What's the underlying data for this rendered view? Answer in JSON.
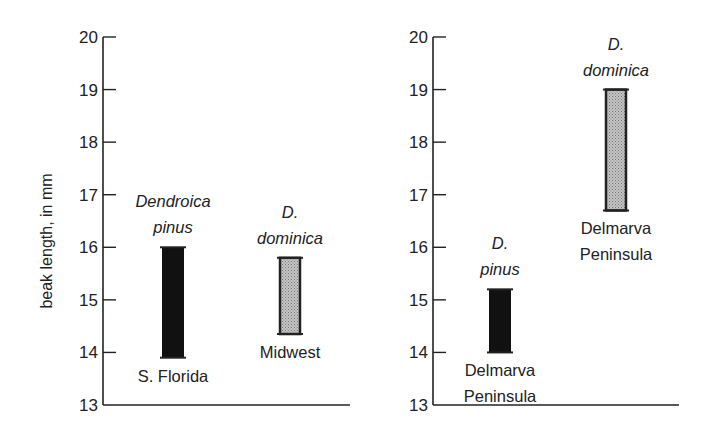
{
  "chart_data": [
    {
      "type": "bar",
      "subtype": "range-bar",
      "title": "",
      "xlabel": "",
      "ylabel": "beak length, in mm",
      "ylim": [
        13,
        20
      ],
      "yticks": [
        13,
        14,
        15,
        16,
        17,
        18,
        19,
        20
      ],
      "grid": false,
      "legend": null,
      "bars": [
        {
          "species": "Dendroica pinus",
          "species_lines": [
            "Dendroica",
            "pinus"
          ],
          "region": "S. Florida",
          "region_lines": [
            "S. Florida"
          ],
          "low": 13.9,
          "high": 16.0,
          "fill": "black"
        },
        {
          "species": "D. dominica",
          "species_lines": [
            "D.",
            "dominica"
          ],
          "region": "Midwest",
          "region_lines": [
            "Midwest"
          ],
          "low": 14.35,
          "high": 15.8,
          "fill": "stippled-gray"
        }
      ]
    },
    {
      "type": "bar",
      "subtype": "range-bar",
      "title": "",
      "xlabel": "",
      "ylabel": "",
      "ylim": [
        13,
        20
      ],
      "yticks": [
        13,
        14,
        15,
        16,
        17,
        18,
        19,
        20
      ],
      "grid": false,
      "legend": null,
      "bars": [
        {
          "species": "D. pinus",
          "species_lines": [
            "D.",
            "pinus"
          ],
          "region": "Delmarva Peninsula",
          "region_lines": [
            "Delmarva",
            "Peninsula"
          ],
          "low": 14.0,
          "high": 15.2,
          "fill": "black"
        },
        {
          "species": "D. dominica",
          "species_lines": [
            "D.",
            "dominica"
          ],
          "region": "Delmarva Peninsula",
          "region_lines": [
            "Delmarva",
            "Peninsula"
          ],
          "low": 16.7,
          "high": 19.0,
          "fill": "stippled-gray"
        }
      ]
    }
  ],
  "colors": {
    "axis": "#222222",
    "black_bar": "#111111",
    "gray_bar": "#b8b8b8",
    "text": "#222222"
  }
}
